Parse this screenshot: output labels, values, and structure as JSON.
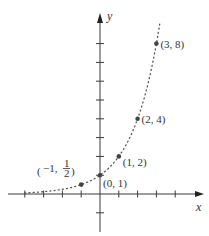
{
  "chart_data": {
    "type": "line",
    "title": "",
    "function": "y = 2^x",
    "xlabel": "x",
    "ylabel": "y",
    "xlim": [
      -5,
      5.5
    ],
    "ylim": [
      -2,
      9.5
    ],
    "x_ticks": [
      -4,
      -3,
      -2,
      -1,
      1,
      2,
      3,
      4
    ],
    "y_ticks": [
      -1,
      1,
      2,
      3,
      4,
      5,
      6,
      7,
      8
    ],
    "grid": false,
    "curve_style": "dotted",
    "curve_domain": [
      -4,
      3.2
    ],
    "points": [
      {
        "x": -1,
        "y": 0.5,
        "label_main": "−1,",
        "label_num": "1",
        "label_den": "2"
      },
      {
        "x": 0,
        "y": 1,
        "label": "(0, 1)"
      },
      {
        "x": 1,
        "y": 2,
        "label": "(1, 2)"
      },
      {
        "x": 2,
        "y": 4,
        "label": "(2, 4)"
      },
      {
        "x": 3,
        "y": 8,
        "label": "(3, 8)"
      }
    ]
  }
}
